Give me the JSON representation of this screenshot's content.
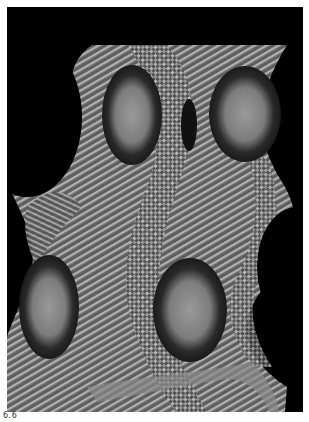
{
  "figure": {
    "caption": "6.6",
    "colors": {
      "background": "#000000",
      "surface_dark": "#3a3a3a",
      "surface_mid": "#7a7a7a",
      "surface_light": "#b8b8b8",
      "eye_center": "#8c8c8c",
      "page": "#ffffff"
    }
  }
}
